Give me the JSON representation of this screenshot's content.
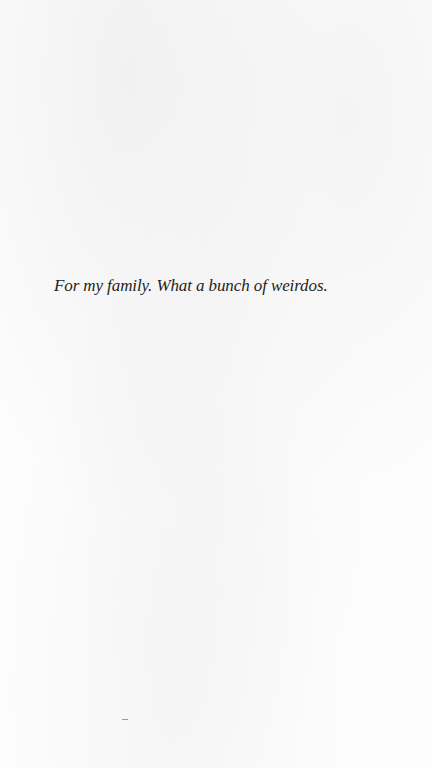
{
  "page": {
    "dedication": "For my family. What a bunch of weirdos.",
    "background_color": "#fcfcfc",
    "text_color": "#1e1e1e"
  }
}
